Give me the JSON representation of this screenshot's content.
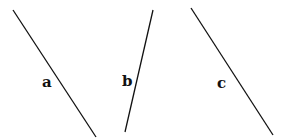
{
  "diagram": {
    "width": 284,
    "height": 139,
    "background": "#ffffff",
    "line_color": "#111111",
    "lines": [
      {
        "id": "a",
        "label": "a",
        "x1": 13,
        "y1": 10,
        "x2": 96,
        "y2": 137,
        "label_x": 42,
        "label_y": 87
      },
      {
        "id": "b",
        "label": "b",
        "x1": 153,
        "y1": 10,
        "x2": 125,
        "y2": 132,
        "label_x": 122,
        "label_y": 86
      },
      {
        "id": "c",
        "label": "c",
        "x1": 191,
        "y1": 8,
        "x2": 273,
        "y2": 135,
        "label_x": 217,
        "label_y": 88
      }
    ]
  }
}
